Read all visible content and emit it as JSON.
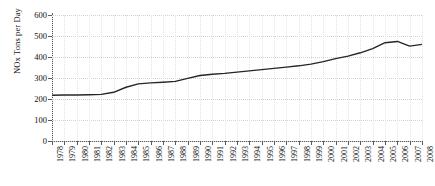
{
  "chart_data": {
    "type": "line",
    "title": "",
    "xlabel": "",
    "ylabel": "NOx Tons per Day",
    "ylim": [
      0,
      600
    ],
    "yticks": [
      0,
      100,
      200,
      300,
      400,
      500,
      600
    ],
    "grid": true,
    "legend": null,
    "line_color": "#262626",
    "categories": [
      "1978",
      "1979",
      "1980",
      "1981",
      "1982",
      "1983",
      "1984",
      "1985",
      "1986",
      "1987",
      "1988",
      "1989",
      "1990",
      "1991",
      "1992",
      "1993",
      "1994",
      "1995",
      "1996",
      "1997",
      "1998",
      "1999",
      "2000",
      "2001",
      "2002",
      "2003",
      "2004",
      "2005",
      "2006",
      "2007",
      "2008"
    ],
    "values": [
      218,
      219,
      219,
      220,
      222,
      232,
      256,
      272,
      277,
      280,
      284,
      298,
      312,
      318,
      322,
      328,
      334,
      340,
      346,
      352,
      358,
      366,
      378,
      392,
      404,
      420,
      440,
      468,
      474,
      452,
      460
    ],
    "series": [
      {
        "name": "NOx Tons per Day",
        "values": [
          218,
          219,
          219,
          220,
          222,
          232,
          256,
          272,
          277,
          280,
          284,
          298,
          312,
          318,
          322,
          328,
          334,
          340,
          346,
          352,
          358,
          366,
          378,
          392,
          404,
          420,
          440,
          468,
          474,
          452,
          460
        ]
      }
    ]
  }
}
